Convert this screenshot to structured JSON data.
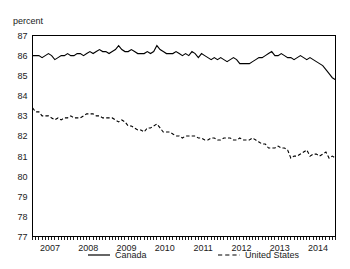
{
  "chart_data": {
    "type": "line",
    "title": "",
    "subtitle": "",
    "xlabel": "",
    "ylabel": "percent",
    "ylim": [
      77,
      87
    ],
    "yticks": [
      77,
      78,
      79,
      80,
      81,
      82,
      83,
      84,
      85,
      86,
      87
    ],
    "ytick_labels": [
      "77",
      "78",
      "79",
      "80",
      "81",
      "82",
      "83",
      "84",
      "85",
      "86",
      "87"
    ],
    "xlim": [
      "2007-01",
      "2014-12"
    ],
    "xticks": [
      "2007",
      "2008",
      "2009",
      "2010",
      "2011",
      "2012",
      "2013",
      "2014"
    ],
    "xtick_labels": [
      "2007",
      "2008",
      "2009",
      "2010",
      "2011",
      "2012",
      "2013",
      "2014"
    ],
    "minor_xticks": "monthly",
    "grid": false,
    "legend_position": "bottom",
    "x": [
      "2007-01",
      "2007-02",
      "2007-03",
      "2007-04",
      "2007-05",
      "2007-06",
      "2007-07",
      "2007-08",
      "2007-09",
      "2007-10",
      "2007-11",
      "2007-12",
      "2008-01",
      "2008-02",
      "2008-03",
      "2008-04",
      "2008-05",
      "2008-06",
      "2008-07",
      "2008-08",
      "2008-09",
      "2008-10",
      "2008-11",
      "2008-12",
      "2009-01",
      "2009-02",
      "2009-03",
      "2009-04",
      "2009-05",
      "2009-06",
      "2009-07",
      "2009-08",
      "2009-09",
      "2009-10",
      "2009-11",
      "2009-12",
      "2010-01",
      "2010-02",
      "2010-03",
      "2010-04",
      "2010-05",
      "2010-06",
      "2010-07",
      "2010-08",
      "2010-09",
      "2010-10",
      "2010-11",
      "2010-12",
      "2011-01",
      "2011-02",
      "2011-03",
      "2011-04",
      "2011-05",
      "2011-06",
      "2011-07",
      "2011-08",
      "2011-09",
      "2011-10",
      "2011-11",
      "2011-12",
      "2012-01",
      "2012-02",
      "2012-03",
      "2012-04",
      "2012-05",
      "2012-06",
      "2012-07",
      "2012-08",
      "2012-09",
      "2012-10",
      "2012-11",
      "2012-12",
      "2013-01",
      "2013-02",
      "2013-03",
      "2013-04",
      "2013-05",
      "2013-06",
      "2013-07",
      "2013-08",
      "2013-09",
      "2013-10",
      "2013-11",
      "2013-12",
      "2014-01",
      "2014-02",
      "2014-03",
      "2014-04",
      "2014-05",
      "2014-06",
      "2014-07",
      "2014-08",
      "2014-09",
      "2014-10",
      "2014-11",
      "2014-12"
    ],
    "series": [
      {
        "name": "Canada",
        "style": "solid",
        "color": "#000000",
        "values": [
          86.0,
          86.0,
          86.0,
          85.9,
          86.0,
          86.1,
          86.0,
          85.8,
          85.9,
          86.0,
          86.0,
          86.1,
          86.0,
          86.0,
          86.1,
          86.1,
          86.0,
          86.1,
          86.2,
          86.1,
          86.2,
          86.3,
          86.2,
          86.2,
          86.1,
          86.2,
          86.3,
          86.5,
          86.3,
          86.2,
          86.2,
          86.3,
          86.2,
          86.1,
          86.1,
          86.1,
          86.2,
          86.1,
          86.2,
          86.5,
          86.3,
          86.2,
          86.1,
          86.1,
          86.1,
          86.2,
          86.1,
          86.0,
          86.1,
          86.0,
          86.2,
          86.1,
          85.9,
          86.1,
          86.0,
          85.9,
          85.8,
          85.9,
          85.8,
          85.9,
          85.8,
          85.7,
          85.8,
          85.9,
          85.8,
          85.6,
          85.6,
          85.6,
          85.6,
          85.7,
          85.8,
          85.9,
          85.9,
          86.0,
          86.1,
          86.2,
          86.0,
          86.0,
          86.1,
          86.0,
          85.9,
          85.9,
          85.8,
          85.9,
          86.0,
          85.9,
          85.8,
          85.9,
          85.8,
          85.7,
          85.6,
          85.5,
          85.3,
          85.1,
          84.9,
          84.8
        ]
      },
      {
        "name": "United States",
        "style": "dashed",
        "color": "#000000",
        "values": [
          83.4,
          83.2,
          83.2,
          83.0,
          83.0,
          83.0,
          82.9,
          82.8,
          82.9,
          82.8,
          82.9,
          82.9,
          83.0,
          82.9,
          82.9,
          82.9,
          83.0,
          83.1,
          83.1,
          83.1,
          83.0,
          83.0,
          82.9,
          82.9,
          82.9,
          82.9,
          82.8,
          82.7,
          82.8,
          82.7,
          82.5,
          82.5,
          82.4,
          82.3,
          82.3,
          82.2,
          82.4,
          82.4,
          82.5,
          82.6,
          82.4,
          82.2,
          82.2,
          82.2,
          82.1,
          82.0,
          82.0,
          81.9,
          82.0,
          82.0,
          82.0,
          82.0,
          81.9,
          81.9,
          81.8,
          81.8,
          81.9,
          81.9,
          81.8,
          81.8,
          81.9,
          81.9,
          81.9,
          81.8,
          81.8,
          81.9,
          81.8,
          81.8,
          81.8,
          81.9,
          81.8,
          81.7,
          81.6,
          81.6,
          81.4,
          81.4,
          81.4,
          81.5,
          81.4,
          81.4,
          81.3,
          80.9,
          81.0,
          81.0,
          81.1,
          81.2,
          81.3,
          81.0,
          81.1,
          81.1,
          81.0,
          81.1,
          81.2,
          80.9,
          81.0,
          80.9
        ]
      }
    ],
    "legend": [
      {
        "label": "Canada",
        "style": "solid"
      },
      {
        "label": "United States",
        "style": "dashed"
      }
    ]
  }
}
